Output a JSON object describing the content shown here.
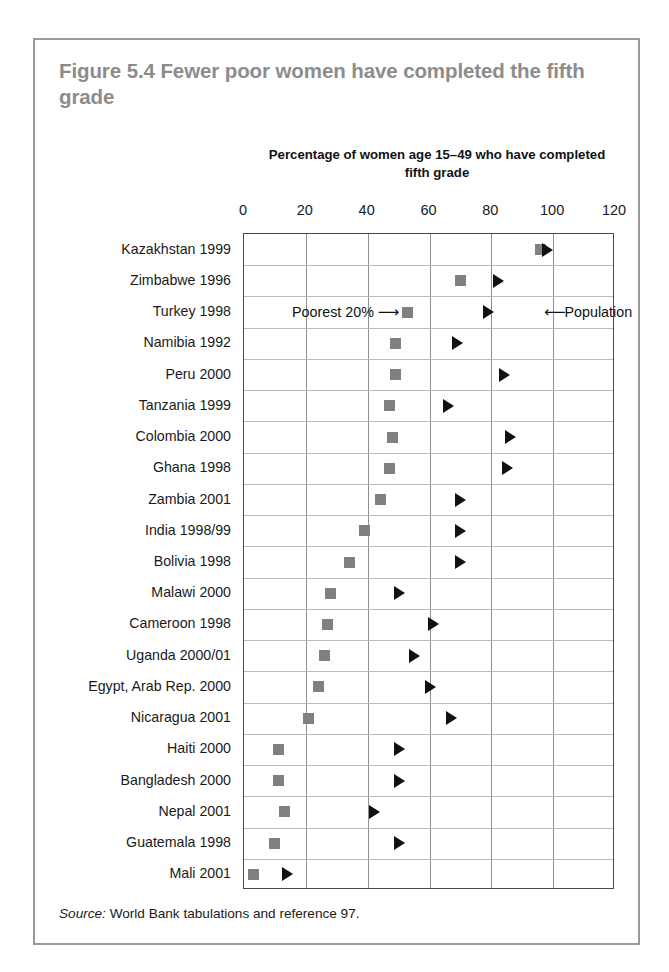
{
  "figure": {
    "title": "Figure 5.4  Fewer poor women have completed the fifth grade",
    "source_label": "Source:",
    "source_text": " World Bank tabulations and reference 97."
  },
  "annotations": {
    "poorest_label": "Poorest 20%",
    "poorest_arrow": "⟶",
    "population_arrow": "⟵",
    "population_label": "Population"
  },
  "colors": {
    "title": "#8c8c8c",
    "square_marker": "#808080",
    "triangle_marker": "#111111",
    "frame": "#4a4a4a",
    "gridline_major": "#8f8f8f",
    "gridline_row": "#b9b9b9",
    "card_border": "#9a9a9a"
  },
  "chart_data": {
    "type": "scatter",
    "title": "Figure 5.4  Fewer poor women have completed the fifth grade",
    "xlabel": "Percentage of women age 15–49 who have completed fifth grade",
    "ylabel": "",
    "xlim": [
      0,
      120
    ],
    "xticks": [
      0,
      20,
      40,
      60,
      80,
      100,
      120
    ],
    "grid": true,
    "legend": [
      "Poorest 20%",
      "Population"
    ],
    "legend_position": "inline-annotation",
    "orientation": "horizontal",
    "categories": [
      "Kazakhstan 1999",
      "Zimbabwe 1996",
      "Turkey 1998",
      "Namibia 1992",
      "Peru 2000",
      "Tanzania 1999",
      "Colombia 2000",
      "Ghana 1998",
      "Zambia 2001",
      "India 1998/99",
      "Bolivia 1998",
      "Malawi 2000",
      "Cameroon 1998",
      "Uganda 2000/01",
      "Egypt, Arab Rep. 2000",
      "Nicaragua 2001",
      "Haiti 2000",
      "Bangladesh 2000",
      "Nepal 2001",
      "Guatemala 1998",
      "Mali 2001"
    ],
    "series": [
      {
        "name": "Poorest 20%",
        "marker": "square",
        "color": "#808080",
        "values": [
          96,
          70,
          53,
          49,
          49,
          47,
          48,
          47,
          44,
          39,
          34,
          28,
          27,
          26,
          24,
          21,
          11,
          11,
          13,
          10,
          3
        ]
      },
      {
        "name": "Population",
        "marker": "triangle",
        "color": "#111111",
        "values": [
          98,
          82,
          79,
          69,
          84,
          66,
          86,
          85,
          70,
          70,
          70,
          50,
          61,
          55,
          60,
          67,
          50,
          50,
          42,
          50,
          14
        ]
      }
    ]
  }
}
